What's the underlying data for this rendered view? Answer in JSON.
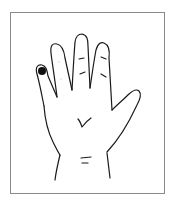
{
  "figure": {
    "marker": {
      "location": "little finger tip",
      "color": "#111111"
    },
    "colors": {
      "line": "#1a1a1a",
      "border": "#8a8a8a",
      "background": "#ffffff"
    }
  }
}
